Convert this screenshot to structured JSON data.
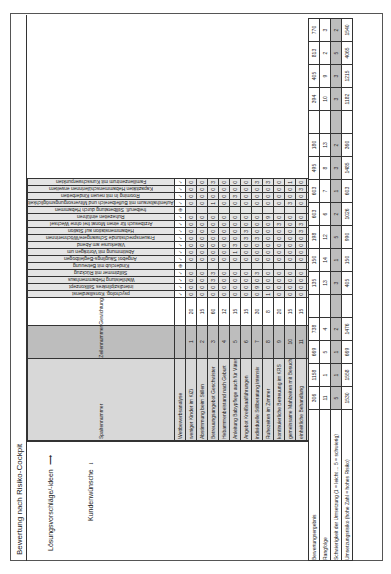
{
  "figure": {
    "title": "Bewertung nach Risiko-Cockpit",
    "axis_solutions": "Lösungsvorschläge/-ideen",
    "axis_wishes": "Kundenwünsche"
  },
  "headers": {
    "column_number": "Spaltennummer",
    "row_number": "Zeilennummer",
    "weighting": "Gewichtung",
    "competitor_analysis": "Wettbewerbsanalyse",
    "correlation_title": "Korrelation Merkmale:",
    "correlation_positive": "Positiv",
    "correlation_none": "Keine",
    "correlation_negative": "Negativ",
    "result": "Bewertungsergebnis",
    "rank": "Rangfolge",
    "difficulty": "Schwierigkeit der Umsetzung (1 = leicht ... 5 = schwierig)",
    "risk": "Umsetzungsrisiko (hohe Zahl = hohes Risiko)"
  },
  "rating_scale": [
    "sehr schlecht",
    "schlecht",
    "mittel",
    "gut",
    "sehr gut"
  ],
  "legend": {
    "own": "▲ = eigene Dienstleistung",
    "competitor": "● = Wettbewerber"
  },
  "wishes": [
    {
      "nr": 1,
      "label": "weniger Kinder im KiZi",
      "weight": 20
    },
    {
      "nr": 2,
      "label": "Abstimmung beim Stillen",
      "weight": 15
    },
    {
      "nr": 3,
      "label": "Betreuungsangebot Geschwister",
      "weight": 60
    },
    {
      "nr": 4,
      "label": "Hebammenbeistand nach Geburt",
      "weight": 12
    },
    {
      "nr": 5,
      "label": "Anleitung Babypflege auch für Väter",
      "weight": 15
    },
    {
      "nr": 6,
      "label": "Angebot Kreißsaalführungen",
      "weight": 15
    },
    {
      "nr": 7,
      "label": "individuelle Stillberatung intensiv",
      "weight": 30
    },
    {
      "nr": 8,
      "label": "Ruhezeiten im Zimmer",
      "weight": 8
    },
    {
      "nr": 9,
      "label": "kontinuierliche Betreuung im KRS",
      "weight": 20
    },
    {
      "nr": 10,
      "label": "gemeinsame Mahlzeiten mit Besuch",
      "weight": 15
    },
    {
      "nr": 11,
      "label": "einheitliche Behandlung",
      "weight": 15
    },
    {
      "nr": 12,
      "label": "psychische Unterstützung",
      "weight": 10
    },
    {
      "nr": 13,
      "label": "Infos über Babyentwicklung",
      "weight": 5
    },
    {
      "nr": 14,
      "label": "verständliche ärztliche Aufklärung",
      "weight": 15
    }
  ],
  "solutions": [
    {
      "nr": 1,
      "label": "psycholog. Konsiliardienst",
      "analysis": "✓",
      "result": 306,
      "rank": 11,
      "difficulty": 5,
      "risk": 1530
    },
    {
      "nr": 2,
      "label": "interdisziplinäres Stillkonzept",
      "analysis": "✓",
      "result": 1158,
      "rank": 1,
      "difficulty": 1,
      "risk": 1558
    },
    {
      "nr": 3,
      "label": "Wahlleistung Hebammenhaus",
      "analysis": "✓",
      "result": 669,
      "rank": 5,
      "difficulty": 1,
      "risk": 669
    },
    {
      "nr": 4,
      "label": "Stillzimmer mit Rückzug",
      "analysis": "✓",
      "result": 738,
      "rank": 4,
      "difficulty": 2,
      "risk": 1476
    },
    {
      "nr": 5,
      "label": "Kinderclub mit Betreuung",
      "analysis": "⊕",
      "result": "",
      "rank": "",
      "difficulty": "",
      "risk": ""
    },
    {
      "nr": 6,
      "label": "Angebot Säuglings-Begleitbogen",
      "analysis": "✓",
      "result": 135,
      "rank": 13,
      "difficulty": 3,
      "risk": 405
    },
    {
      "nr": 7,
      "label": "Abstimmung mit Vorträgen um",
      "analysis": "✓",
      "result": 150,
      "rank": 14,
      "difficulty": 1,
      "risk": 150
    },
    {
      "nr": 8,
      "label": "Väterkurse am Abend",
      "analysis": "✓",
      "result": 198,
      "rank": 12,
      "difficulty": 5,
      "risk": 990
    },
    {
      "nr": 9,
      "label": "Frauensprechstunde Schwangere/Wöchnerinnen",
      "analysis": "✓",
      "result": 603,
      "rank": 6,
      "difficulty": 2,
      "risk": 1026
    },
    {
      "nr": 10,
      "label": "Hebammenstation auf Station",
      "analysis": "✓",
      "result": 603,
      "rank": 7,
      "difficulty": 1,
      "risk": 603
    },
    {
      "nr": 11,
      "label": "Arztbesuch für einen Monat frei ohne Wechsel",
      "analysis": "✓",
      "result": 495,
      "rank": 8,
      "difficulty": 3,
      "risk": 1485
    },
    {
      "nr": 12,
      "label": "Ruhezeiten einführen",
      "analysis": "✓",
      "result": 180,
      "rank": 13,
      "difficulty": 2,
      "risk": 360
    },
    {
      "nr": 13,
      "label": "freiberufl. Stillberatung durch Hebammen",
      "analysis": "⊕",
      "result": "",
      "rank": "",
      "difficulty": "",
      "risk": ""
    },
    {
      "nr": 14,
      "label": "Aufenthaltsraum mit Buffetbereich und Mitversorgungsmöglichkeit",
      "analysis": "✓",
      "result": 394,
      "rank": 10,
      "difficulty": 3,
      "risk": 1182
    },
    {
      "nr": 15,
      "label": "Rooming In mit neuen Kinderbetten",
      "analysis": "✓",
      "result": 405,
      "rank": 9,
      "difficulty": 3,
      "risk": 1215
    },
    {
      "nr": 16,
      "label": "Kapazitäten Hebammenschülerinnen erweitern",
      "analysis": "✓",
      "result": 813,
      "rank": 2,
      "difficulty": 5,
      "risk": 4065
    },
    {
      "nr": 17,
      "label": "Familienzentrum mit Kursschwerpunkten",
      "analysis": "✓",
      "result": 770,
      "rank": 3,
      "difficulty": 2,
      "risk": 1540
    }
  ],
  "matrix": [
    [
      0,
      0,
      0,
      0,
      0,
      0,
      0,
      1,
      0,
      0,
      0,
      0,
      0,
      0
    ],
    [
      0,
      0,
      0,
      0,
      0,
      0,
      9,
      0,
      0,
      0,
      0,
      0,
      0,
      0
    ],
    [
      0,
      0,
      3,
      0,
      0,
      0,
      0,
      0,
      0,
      0,
      0,
      0,
      0,
      0
    ],
    [
      0,
      0,
      3,
      0,
      0,
      0,
      3,
      0,
      0,
      0,
      0,
      0,
      0,
      0
    ],
    [],
    [
      0,
      0,
      0,
      0,
      0,
      0,
      0,
      0,
      0,
      0,
      0,
      0,
      0,
      0
    ],
    [
      0,
      0,
      0,
      0,
      1,
      0,
      0,
      0,
      0,
      0,
      0,
      0,
      0,
      0
    ],
    [
      0,
      0,
      0,
      0,
      3,
      0,
      0,
      0,
      0,
      0,
      0,
      0,
      0,
      0
    ],
    [
      0,
      0,
      0,
      0,
      0,
      3,
      3,
      0,
      0,
      0,
      0,
      0,
      0,
      0
    ],
    [
      0,
      0,
      0,
      0,
      0,
      3,
      0,
      0,
      0,
      0,
      3,
      0,
      0,
      0
    ],
    [
      0,
      0,
      0,
      0,
      0,
      0,
      0,
      0,
      3,
      0,
      3,
      0,
      0,
      0
    ],
    [
      0,
      0,
      0,
      0,
      0,
      0,
      0,
      9,
      0,
      0,
      0,
      0,
      0,
      0
    ],
    [],
    [
      0,
      0,
      1,
      0,
      0,
      0,
      0,
      0,
      0,
      3,
      0,
      1,
      0,
      0
    ],
    [
      0,
      0,
      0,
      0,
      3,
      0,
      0,
      0,
      0,
      0,
      0,
      0,
      0,
      0
    ],
    [
      0,
      0,
      0,
      0,
      0,
      0,
      0,
      0,
      0,
      0,
      3,
      0,
      0,
      0
    ],
    [
      0,
      0,
      3,
      0,
      0,
      0,
      3,
      3,
      0,
      1,
      0,
      3,
      0,
      0
    ]
  ],
  "competitor_ratings": {
    "own": [
      "schlecht",
      "schlecht",
      "mittel",
      "sehr schlecht",
      "mittel",
      "mittel",
      "mittel",
      "mittel",
      "sehr gut",
      "schlecht",
      "schlecht",
      "mittel",
      "mittel",
      "mittel"
    ],
    "competitor": [
      "mittel",
      "mittel",
      "sehr schlecht",
      "schlecht",
      "mittel",
      "gut",
      "sehr schlecht",
      "gut",
      "mittel",
      "mittel",
      "mittel",
      "mittel",
      "gut",
      "gut"
    ]
  }
}
